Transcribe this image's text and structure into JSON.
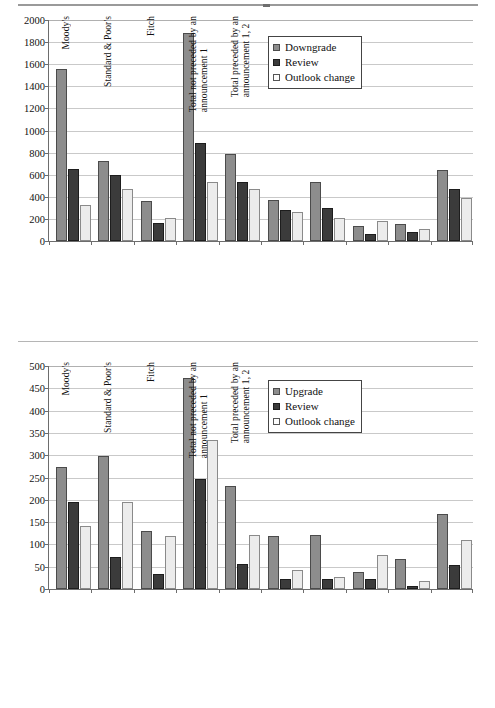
{
  "figure": {
    "separator": "horizontal-rule"
  },
  "chart_data": [
    {
      "type": "bar",
      "title": "",
      "subtitle": "",
      "xlabel": "",
      "ylabel": "",
      "ylim": [
        0,
        2000
      ],
      "yticks": [
        0,
        200,
        400,
        600,
        800,
        1000,
        1200,
        1400,
        1600,
        1800,
        2000
      ],
      "grid": true,
      "legend_position": "top-right",
      "categories": [
        "Moody's",
        "Standard & Poor's",
        "Fitch",
        "Total not preceded by an announcement 1",
        "Total preceded by an announcement 1, 2",
        "",
        "",
        "",
        ""
      ],
      "category_lines": [
        [
          "Moody's"
        ],
        [
          "Standard & Poor's"
        ],
        [
          "Fitch"
        ],
        [
          "Total not preceded by an",
          "announcement 1"
        ],
        [
          "Total preceded by an",
          "announcement 1, 2"
        ],
        [
          ""
        ],
        [
          ""
        ],
        [
          ""
        ],
        [
          ""
        ]
      ],
      "series": [
        {
          "name": "Downgrade",
          "color": "#8d8d8d",
          "values": [
            1560,
            720,
            365,
            1880,
            785,
            370,
            530,
            140,
            155,
            645
          ]
        },
        {
          "name": "Review",
          "color": "#3b3b3b",
          "values": [
            650,
            595,
            165,
            885,
            530,
            280,
            300,
            60,
            80,
            470
          ]
        },
        {
          "name": "Outlook change",
          "color": "#ececec",
          "values": [
            325,
            470,
            205,
            535,
            470,
            260,
            205,
            185,
            110,
            385
          ]
        }
      ]
    },
    {
      "type": "bar",
      "title": "",
      "subtitle": "",
      "xlabel": "",
      "ylabel": "",
      "ylim": [
        0,
        500
      ],
      "yticks": [
        0,
        50,
        100,
        150,
        200,
        250,
        300,
        350,
        400,
        450,
        500
      ],
      "grid": true,
      "legend_position": "top-right",
      "categories": [
        "Moody's",
        "Standard & Poor's",
        "Fitch",
        "Total not preceded by an announcement 1",
        "Total preceded by an announcement 1, 2",
        "",
        "",
        "",
        ""
      ],
      "category_lines": [
        [
          "Moody's"
        ],
        [
          "Standard & Poor's"
        ],
        [
          "Fitch"
        ],
        [
          "Total not preceded by an",
          "announcement 1"
        ],
        [
          "Total preceded by an",
          "announcement 1, 2"
        ],
        [
          ""
        ],
        [
          ""
        ],
        [
          ""
        ],
        [
          ""
        ]
      ],
      "series": [
        {
          "name": "Upgrade",
          "color": "#8d8d8d",
          "values": [
            273,
            299,
            130,
            474,
            230,
            119,
            121,
            38,
            67,
            168
          ]
        },
        {
          "name": "Review",
          "color": "#3b3b3b",
          "values": [
            195,
            72,
            33,
            246,
            56,
            23,
            23,
            23,
            7,
            54
          ]
        },
        {
          "name": "Outlook change",
          "color": "#ececec",
          "values": [
            142,
            196,
            118,
            335,
            122,
            42,
            27,
            76,
            19,
            111
          ]
        }
      ]
    }
  ],
  "charts": {
    "top": {
      "legend": {
        "items": [
          {
            "label": "Downgrade",
            "swatch": "legend-swatch-downgrade"
          },
          {
            "label": "Review",
            "swatch": "legend-swatch-review"
          },
          {
            "label": "Outlook change",
            "swatch": "legend-swatch-outlook-change"
          }
        ]
      }
    },
    "bottom": {
      "legend": {
        "items": [
          {
            "label": "Upgrade",
            "swatch": "legend-swatch-upgrade"
          },
          {
            "label": "Review",
            "swatch": "legend-swatch-review"
          },
          {
            "label": "Outlook change",
            "swatch": "legend-swatch-outlook-change"
          }
        ]
      }
    }
  }
}
